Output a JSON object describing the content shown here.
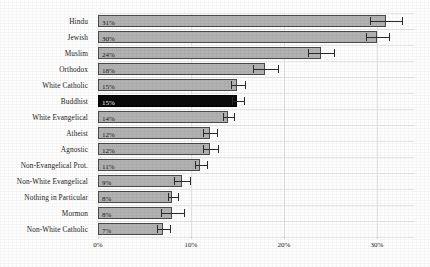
{
  "chart_data": {
    "type": "bar",
    "orientation": "horizontal",
    "title": "",
    "xlabel": "",
    "ylabel": "",
    "xlim": [
      0,
      34
    ],
    "xticks": [
      "0%",
      "10%",
      "20%",
      "30%"
    ],
    "xtick_values": [
      0,
      10,
      20,
      30
    ],
    "grid": true,
    "legend": "none",
    "highlight_category": "Buddhist",
    "colors": {
      "bar": "#b2b2b2",
      "bar_highlight": "#0a0a0a",
      "bar_border": "#4a4a4a",
      "error_bar": "#2b2b2b",
      "gridline": "#e5e5e5",
      "background": "#ffffff",
      "text": "#1b1b1b"
    },
    "categories": [
      "Hindu",
      "Jewish",
      "Muslim",
      "Orthodox",
      "White Catholic",
      "Buddhist",
      "White Evangelical",
      "Atheist",
      "Agnostic",
      "Non-Evangelical Prot.",
      "Non-White Evangelical",
      "Nothing in Particular",
      "Mormon",
      "Non-White Catholic"
    ],
    "values": [
      31,
      30,
      24,
      18,
      15,
      15,
      14,
      12,
      12,
      11,
      9,
      8,
      8,
      7
    ],
    "value_labels": [
      "31%",
      "30%",
      "24%",
      "18%",
      "15%",
      "15%",
      "14%",
      "12%",
      "12%",
      "11%",
      "9%",
      "8%",
      "8%",
      "7%"
    ],
    "error_low": [
      29.3,
      28.8,
      22.6,
      16.7,
      14.3,
      14.4,
      13.5,
      11.3,
      11.3,
      10.4,
      8.2,
      7.5,
      6.8,
      6.4
    ],
    "error_high": [
      32.7,
      31.3,
      25.4,
      19.4,
      15.8,
      15.7,
      14.6,
      12.8,
      12.9,
      11.7,
      9.9,
      8.6,
      9.3,
      7.7
    ],
    "bars": [
      {
        "category": "Hindu",
        "value": 31,
        "label": "31%",
        "low": 29.3,
        "high": 32.7,
        "highlight": false
      },
      {
        "category": "Jewish",
        "value": 30,
        "label": "30%",
        "low": 28.8,
        "high": 31.3,
        "highlight": false
      },
      {
        "category": "Muslim",
        "value": 24,
        "label": "24%",
        "low": 22.6,
        "high": 25.4,
        "highlight": false
      },
      {
        "category": "Orthodox",
        "value": 18,
        "label": "18%",
        "low": 16.7,
        "high": 19.4,
        "highlight": false
      },
      {
        "category": "White Catholic",
        "value": 15,
        "label": "15%",
        "low": 14.3,
        "high": 15.8,
        "highlight": false
      },
      {
        "category": "Buddhist",
        "value": 15,
        "label": "15%",
        "low": 14.4,
        "high": 15.7,
        "highlight": true
      },
      {
        "category": "White Evangelical",
        "value": 14,
        "label": "14%",
        "low": 13.5,
        "high": 14.6,
        "highlight": false
      },
      {
        "category": "Atheist",
        "value": 12,
        "label": "12%",
        "low": 11.3,
        "high": 12.8,
        "highlight": false
      },
      {
        "category": "Agnostic",
        "value": 12,
        "label": "12%",
        "low": 11.3,
        "high": 12.9,
        "highlight": false
      },
      {
        "category": "Non-Evangelical Prot.",
        "value": 11,
        "label": "11%",
        "low": 10.4,
        "high": 11.7,
        "highlight": false
      },
      {
        "category": "Non-White Evangelical",
        "value": 9,
        "label": "9%",
        "low": 8.2,
        "high": 9.9,
        "highlight": false
      },
      {
        "category": "Nothing in Particular",
        "value": 8,
        "label": "8%",
        "low": 7.5,
        "high": 8.6,
        "highlight": false
      },
      {
        "category": "Mormon",
        "value": 8,
        "label": "8%",
        "low": 6.8,
        "high": 9.3,
        "highlight": false
      },
      {
        "category": "Non-White Catholic",
        "value": 7,
        "label": "7%",
        "low": 6.4,
        "high": 7.7,
        "highlight": false
      }
    ]
  }
}
